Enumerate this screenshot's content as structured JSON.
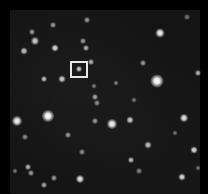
{
  "image": {
    "description": "Grayscale astronomical star field with a white square marker around a faint target star",
    "width": 208,
    "height": 194,
    "background_color": "#141414",
    "border_color": "#000000"
  },
  "marker": {
    "x": 70,
    "y": 61,
    "width": 18,
    "height": 17,
    "color": "#e8e8e8"
  },
  "stars": [
    {
      "x": 79,
      "y": 69,
      "r": 1.5,
      "b": 0.8
    },
    {
      "x": 160,
      "y": 33,
      "r": 3,
      "b": 0.95
    },
    {
      "x": 157,
      "y": 81,
      "r": 5,
      "b": 1.0
    },
    {
      "x": 48,
      "y": 116,
      "r": 4.5,
      "b": 1.0
    },
    {
      "x": 17,
      "y": 121,
      "r": 3.5,
      "b": 0.95
    },
    {
      "x": 112,
      "y": 124,
      "r": 3.5,
      "b": 0.95
    },
    {
      "x": 184,
      "y": 118,
      "r": 2.5,
      "b": 0.9
    },
    {
      "x": 80,
      "y": 179,
      "r": 2.5,
      "b": 0.9
    },
    {
      "x": 194,
      "y": 150,
      "r": 2,
      "b": 0.85
    },
    {
      "x": 182,
      "y": 177,
      "r": 2,
      "b": 0.85
    },
    {
      "x": 55,
      "y": 48,
      "r": 2,
      "b": 0.85
    },
    {
      "x": 35,
      "y": 41,
      "r": 2.5,
      "b": 0.8
    },
    {
      "x": 24,
      "y": 51,
      "r": 2,
      "b": 0.75
    },
    {
      "x": 86,
      "y": 48,
      "r": 1.5,
      "b": 0.7
    },
    {
      "x": 32,
      "y": 32,
      "r": 1.5,
      "b": 0.6
    },
    {
      "x": 53,
      "y": 25,
      "r": 1.5,
      "b": 0.6
    },
    {
      "x": 87,
      "y": 20,
      "r": 1.5,
      "b": 0.6
    },
    {
      "x": 62,
      "y": 79,
      "r": 2,
      "b": 0.8
    },
    {
      "x": 44,
      "y": 79,
      "r": 1.5,
      "b": 0.75
    },
    {
      "x": 91,
      "y": 62,
      "r": 1.5,
      "b": 0.7
    },
    {
      "x": 83,
      "y": 41,
      "r": 1.5,
      "b": 0.6
    },
    {
      "x": 95,
      "y": 97,
      "r": 1.5,
      "b": 0.65
    },
    {
      "x": 143,
      "y": 63,
      "r": 1.5,
      "b": 0.6
    },
    {
      "x": 198,
      "y": 73,
      "r": 1.5,
      "b": 0.7
    },
    {
      "x": 130,
      "y": 120,
      "r": 2,
      "b": 0.8
    },
    {
      "x": 148,
      "y": 145,
      "r": 2,
      "b": 0.75
    },
    {
      "x": 131,
      "y": 160,
      "r": 1.5,
      "b": 0.75
    },
    {
      "x": 95,
      "y": 121,
      "r": 1.5,
      "b": 0.6
    },
    {
      "x": 68,
      "y": 135,
      "r": 1.5,
      "b": 0.6
    },
    {
      "x": 82,
      "y": 152,
      "r": 1.5,
      "b": 0.55
    },
    {
      "x": 28,
      "y": 167,
      "r": 1.5,
      "b": 0.7
    },
    {
      "x": 31,
      "y": 173,
      "r": 1.5,
      "b": 0.6
    },
    {
      "x": 54,
      "y": 178,
      "r": 1.5,
      "b": 0.6
    },
    {
      "x": 44,
      "y": 185,
      "r": 1.5,
      "b": 0.65
    },
    {
      "x": 25,
      "y": 137,
      "r": 1.5,
      "b": 0.55
    },
    {
      "x": 139,
      "y": 171,
      "r": 1.5,
      "b": 0.5
    },
    {
      "x": 187,
      "y": 17,
      "r": 1.5,
      "b": 0.45
    },
    {
      "x": 94,
      "y": 86,
      "r": 1,
      "b": 0.5
    },
    {
      "x": 134,
      "y": 100,
      "r": 1,
      "b": 0.5
    },
    {
      "x": 97,
      "y": 103,
      "r": 1.5,
      "b": 0.55
    },
    {
      "x": 175,
      "y": 133,
      "r": 1,
      "b": 0.45
    },
    {
      "x": 198,
      "y": 168,
      "r": 1,
      "b": 0.45
    },
    {
      "x": 116,
      "y": 83,
      "r": 1,
      "b": 0.5
    },
    {
      "x": 15,
      "y": 171,
      "r": 1,
      "b": 0.45
    }
  ]
}
